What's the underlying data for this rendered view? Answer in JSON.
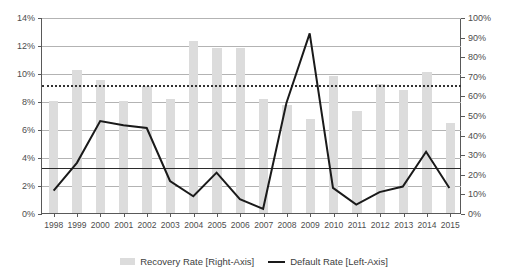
{
  "chart_data": {
    "type": "bar",
    "title": "",
    "xlabel": "",
    "ylabel": "",
    "grid": true,
    "legend_position": "bottom",
    "categories": [
      "1998",
      "1999",
      "2000",
      "2001",
      "2002",
      "2003",
      "2004",
      "2005",
      "2006",
      "2007",
      "2008",
      "2009",
      "2010",
      "2011",
      "2012",
      "2013",
      "2014",
      "2015"
    ],
    "left_axis": {
      "label": "Default Rate [Left-Axis]",
      "min": 0,
      "max": 14,
      "step": 2,
      "ticks": [
        "0%",
        "2%",
        "4%",
        "6%",
        "8%",
        "10%",
        "12%",
        "14%"
      ],
      "tick_values": [
        0,
        2,
        4,
        6,
        8,
        10,
        12,
        14
      ]
    },
    "right_axis": {
      "label": "Recovery Rate [Right-Axis]",
      "min": 0,
      "max": 100,
      "step": 10,
      "ticks": [
        "0%",
        "10%",
        "20%",
        "30%",
        "40%",
        "50%",
        "60%",
        "70%",
        "80%",
        "90%",
        "100%"
      ],
      "tick_values": [
        0,
        10,
        20,
        30,
        40,
        50,
        60,
        70,
        80,
        90,
        100
      ]
    },
    "series": [
      {
        "name": "Recovery Rate [Right-Axis]",
        "type": "bar",
        "axis": "right",
        "color": "#dcdcdc",
        "values": [
          57,
          73,
          68,
          57,
          65,
          58,
          88,
          84,
          84,
          58,
          55,
          48,
          70,
          52,
          66,
          63,
          72,
          46
        ]
      },
      {
        "name": "Default Rate [Left-Axis]",
        "type": "line",
        "axis": "left",
        "color": "#1a1a1a",
        "values": [
          1.6,
          3.6,
          6.6,
          6.3,
          6.1,
          2.3,
          1.2,
          2.9,
          1.0,
          0.3,
          7.9,
          12.9,
          1.8,
          0.6,
          1.5,
          1.9,
          4.4,
          1.8
        ]
      }
    ],
    "reference_lines": [
      {
        "name": "average-recovery-rate",
        "style": "dotted",
        "axis": "right",
        "value": 66,
        "color": "#333333"
      },
      {
        "name": "average-default-rate",
        "style": "solid",
        "axis": "left",
        "value": 3.3,
        "color": "#2b2b2b"
      }
    ]
  },
  "legend": {
    "items": [
      {
        "label": "Recovery Rate [Right-Axis]",
        "marker": "bar-swatch",
        "color": "#dcdcdc"
      },
      {
        "label": "Default Rate [Left-Axis]",
        "marker": "line-swatch",
        "color": "#1a1a1a"
      }
    ]
  }
}
